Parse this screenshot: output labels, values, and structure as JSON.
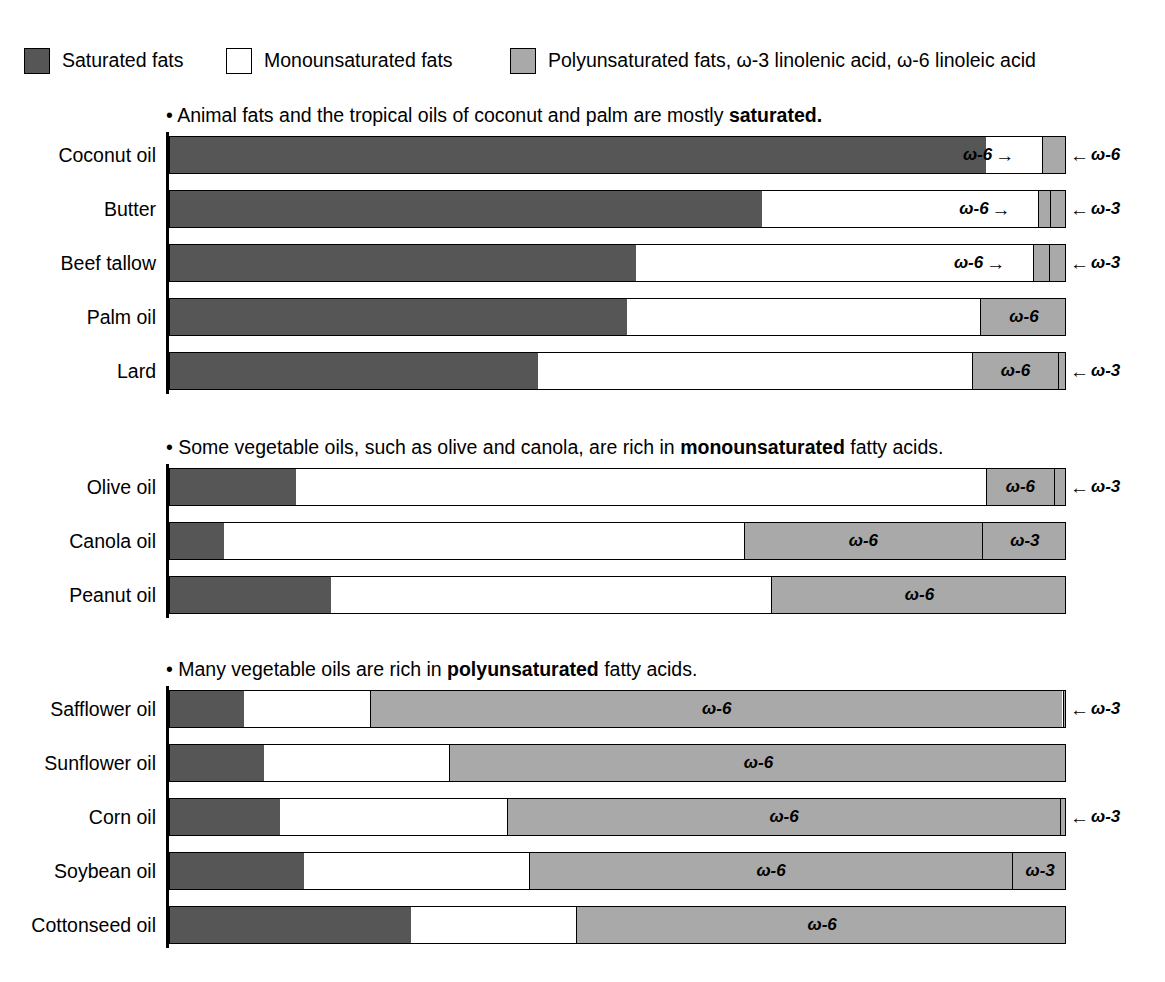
{
  "legend": {
    "items": [
      {
        "label": "Saturated fats",
        "color": "#565656",
        "key": "saturated"
      },
      {
        "label": "Monounsaturated fats",
        "color": "#ffffff",
        "key": "monounsaturated"
      },
      {
        "label": "Polyunsaturated fats, ω-3 linolenic acid, ω-6 linoleic acid",
        "color": "#a9a9a9",
        "key": "polyunsaturated"
      }
    ]
  },
  "labels": {
    "omega6": "ω-6",
    "omega3": "ω-3",
    "arrow_left": "←",
    "arrow_right": "→"
  },
  "sections": [
    {
      "id": "saturated-section",
      "heading_prefix": "• Animal fats and the tropical oils of coconut and palm are mostly ",
      "heading_bold": "saturated.",
      "heading_suffix": "",
      "rows": [
        {
          "label": "Coconut oil",
          "saturated": 91.0,
          "monounsaturated": 6.2,
          "omega6": 2.6,
          "omega3": 0.0
        },
        {
          "label": "Butter",
          "saturated": 66.0,
          "monounsaturated": 30.8,
          "omega6": 1.3,
          "omega3": 1.9
        },
        {
          "label": "Beef tallow",
          "saturated": 52.0,
          "monounsaturated": 44.2,
          "omega6": 1.8,
          "omega3": 2.0
        },
        {
          "label": "Palm oil",
          "saturated": 51.0,
          "monounsaturated": 39.3,
          "omega6": 9.7,
          "omega3": 0.0
        },
        {
          "label": "Lard",
          "saturated": 41.0,
          "monounsaturated": 48.4,
          "omega6": 9.6,
          "omega3": 1.0
        }
      ]
    },
    {
      "id": "monounsaturated-section",
      "heading_prefix": "• Some vegetable oils, such as olive and canola, are rich in ",
      "heading_bold": "monounsaturated",
      "heading_suffix": " fatty acids.",
      "rows": [
        {
          "label": "Olive oil",
          "saturated": 14.0,
          "monounsaturated": 77.0,
          "omega6": 7.5,
          "omega3": 1.5
        },
        {
          "label": "Canola oil",
          "saturated": 6.0,
          "monounsaturated": 58.0,
          "omega6": 26.5,
          "omega3": 9.5
        },
        {
          "label": "Peanut oil",
          "saturated": 18.0,
          "monounsaturated": 49.0,
          "omega6": 33.0,
          "omega3": 0.0
        }
      ]
    },
    {
      "id": "polyunsaturated-section",
      "heading_prefix": "• Many vegetable oils are rich in ",
      "heading_bold": "polyunsaturated",
      "heading_suffix": " fatty acids.",
      "rows": [
        {
          "label": "Safflower oil",
          "saturated": 8.3,
          "monounsaturated": 14.0,
          "omega6": 77.2,
          "omega3": 0.5
        },
        {
          "label": "Sunflower oil",
          "saturated": 10.5,
          "monounsaturated": 20.6,
          "omega6": 68.9,
          "omega3": 0.0
        },
        {
          "label": "Corn oil",
          "saturated": 12.3,
          "monounsaturated": 25.3,
          "omega6": 61.6,
          "omega3": 0.8
        },
        {
          "label": "Soybean oil",
          "saturated": 14.9,
          "monounsaturated": 25.1,
          "omega6": 53.9,
          "omega3": 6.1
        },
        {
          "label": "Cottonseed oil",
          "saturated": 26.9,
          "monounsaturated": 18.4,
          "omega6": 54.7,
          "omega3": 0.0
        }
      ]
    }
  ],
  "chart_data": {
    "type": "bar",
    "orientation": "horizontal",
    "stacked": true,
    "xlabel": "",
    "ylabel": "",
    "xlim": [
      0,
      100
    ],
    "units": "percent of total fatty acids",
    "grid": false,
    "legend_position": "top",
    "series": [
      {
        "name": "Saturated fats",
        "color": "#565656"
      },
      {
        "name": "Monounsaturated fats",
        "color": "#ffffff"
      },
      {
        "name": "Polyunsaturated fats, ω-6 linoleic acid",
        "color": "#a9a9a9"
      },
      {
        "name": "Polyunsaturated fats, ω-3 linolenic acid",
        "color": "#a9a9a9"
      }
    ],
    "categories": [
      "Coconut oil",
      "Butter",
      "Beef tallow",
      "Palm oil",
      "Lard",
      "Olive oil",
      "Canola oil",
      "Peanut oil",
      "Safflower oil",
      "Sunflower oil",
      "Corn oil",
      "Soybean oil",
      "Cottonseed oil"
    ],
    "values": {
      "Saturated fats": [
        91.0,
        66.0,
        52.0,
        51.0,
        41.0,
        14.0,
        6.0,
        18.0,
        8.3,
        10.5,
        12.3,
        14.9,
        26.9
      ],
      "Monounsaturated fats": [
        6.2,
        30.8,
        44.2,
        39.3,
        48.4,
        77.0,
        58.0,
        49.0,
        14.0,
        20.6,
        25.3,
        25.1,
        18.4
      ],
      "omega-6": [
        2.6,
        1.3,
        1.8,
        9.7,
        9.6,
        7.5,
        26.5,
        33.0,
        77.2,
        68.9,
        61.6,
        53.9,
        54.7
      ],
      "omega-3": [
        0.0,
        1.9,
        2.0,
        0.0,
        1.0,
        1.5,
        9.5,
        0.0,
        0.5,
        0.0,
        0.8,
        6.1,
        0.0
      ]
    },
    "annotations": [
      "Animal fats and the tropical oils of coconut and palm are mostly saturated.",
      "Some vegetable oils, such as olive and canola, are rich in monounsaturated fatty acids.",
      "Many vegetable oils are rich in polyunsaturated fatty acids."
    ]
  }
}
